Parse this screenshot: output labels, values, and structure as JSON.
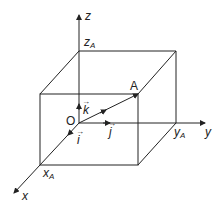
{
  "diagram": {
    "type": "3d-coordinate-box",
    "axes": {
      "x": "x",
      "y": "y",
      "z": "z"
    },
    "point": "A",
    "origin": "O",
    "unit_vectors": {
      "i": "i",
      "j": "j",
      "k": "k"
    },
    "coordinates": {
      "x": "x",
      "y": "y",
      "z": "z",
      "sub": "A"
    },
    "colors": {
      "line": "#222222",
      "background": "#ffffff"
    }
  }
}
